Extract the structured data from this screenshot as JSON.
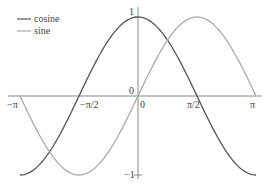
{
  "chart_data": {
    "type": "line",
    "title": "",
    "xlabel": "",
    "ylabel": "",
    "xlim": [
      -3.14159,
      3.14159
    ],
    "ylim": [
      -1,
      1
    ],
    "grid": false,
    "legend_position": "top-left",
    "x_ticks": [
      {
        "value": -3.14159,
        "label": "−π"
      },
      {
        "value": -1.5708,
        "label": "−π/2"
      },
      {
        "value": 0,
        "label": "0"
      },
      {
        "value": 1.5708,
        "label": "π/2"
      },
      {
        "value": 3.14159,
        "label": "π"
      }
    ],
    "y_ticks": [
      {
        "value": 1,
        "label": "1"
      },
      {
        "value": 0,
        "label": "0"
      },
      {
        "value": -1,
        "label": "−1"
      }
    ],
    "series": [
      {
        "name": "cosine",
        "color": "#555555",
        "function": "cos(x)",
        "x": [
          -3.1416,
          -2.3562,
          -1.5708,
          -0.7854,
          0,
          0.7854,
          1.5708,
          2.3562,
          3.1416
        ],
        "values": [
          -1,
          -0.707,
          0,
          0.707,
          1,
          0.707,
          0,
          -0.707,
          -1
        ]
      },
      {
        "name": "sine",
        "color": "#aaaaaa",
        "function": "sin(x)",
        "x": [
          -3.1416,
          -2.3562,
          -1.5708,
          -0.7854,
          0,
          0.7854,
          1.5708,
          2.3562,
          3.1416
        ],
        "values": [
          0,
          -0.707,
          -1,
          -0.707,
          0,
          0.707,
          1,
          0.707,
          0
        ]
      }
    ]
  },
  "legend": [
    {
      "label": "cosine",
      "color": "#555555"
    },
    {
      "label": "sine",
      "color": "#aaaaaa"
    }
  ],
  "axes": {
    "color": "#888888",
    "x_tick_labels": [
      "−π",
      "−π/2",
      "0",
      "π/2",
      "π"
    ],
    "y_tick_labels": {
      "top": "1",
      "origin": "0",
      "bottom": "−1"
    }
  }
}
